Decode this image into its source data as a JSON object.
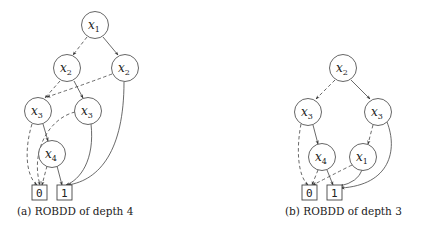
{
  "figures": [
    {
      "id": "a",
      "caption": "(a) ROBDD of depth 4",
      "nodes": [
        {
          "id": "a_x1",
          "var": "x",
          "sub": "1",
          "cx": 95,
          "cy": 25
        },
        {
          "id": "a_x2L",
          "var": "x",
          "sub": "2",
          "cx": 67,
          "cy": 68
        },
        {
          "id": "a_x2R",
          "var": "x",
          "sub": "2",
          "cx": 125,
          "cy": 68
        },
        {
          "id": "a_x3L",
          "var": "x",
          "sub": "3",
          "cx": 38,
          "cy": 111
        },
        {
          "id": "a_x3R",
          "var": "x",
          "sub": "3",
          "cx": 88,
          "cy": 111
        },
        {
          "id": "a_x4",
          "var": "x",
          "sub": "4",
          "cx": 52,
          "cy": 154
        }
      ],
      "terminals": [
        {
          "id": "a_0",
          "label": "0",
          "x": 32,
          "y": 185
        },
        {
          "id": "a_1",
          "label": "1",
          "x": 57,
          "y": 185
        }
      ],
      "edges": [
        {
          "from": "a_x1",
          "to": "a_x2L",
          "type": "dashed"
        },
        {
          "from": "a_x1",
          "to": "a_x2R",
          "type": "solid"
        },
        {
          "from": "a_x2L",
          "to": "a_x3L",
          "type": "dashed"
        },
        {
          "from": "a_x2L",
          "to": "a_x3R",
          "type": "solid"
        },
        {
          "from": "a_x2R",
          "to": "a_x3L",
          "type": "dashed"
        },
        {
          "from": "a_x2R",
          "to": "a_1",
          "type": "solid"
        },
        {
          "from": "a_x3L",
          "to": "a_0",
          "type": "dashed"
        },
        {
          "from": "a_x3L",
          "to": "a_x4",
          "type": "solid"
        },
        {
          "from": "a_x3R",
          "to": "a_0",
          "type": "dashed"
        },
        {
          "from": "a_x3R",
          "to": "a_1",
          "type": "solid"
        },
        {
          "from": "a_x4",
          "to": "a_0",
          "type": "dashed"
        },
        {
          "from": "a_x4",
          "to": "a_1",
          "type": "solid"
        }
      ]
    },
    {
      "id": "b",
      "caption": "(b) ROBDD of depth 3",
      "nodes": [
        {
          "id": "b_x2",
          "var": "x",
          "sub": "2",
          "cx": 343,
          "cy": 68
        },
        {
          "id": "b_x3L",
          "var": "x",
          "sub": "3",
          "cx": 308,
          "cy": 112
        },
        {
          "id": "b_x3R",
          "var": "x",
          "sub": "3",
          "cx": 378,
          "cy": 112
        },
        {
          "id": "b_x4",
          "var": "x",
          "sub": "4",
          "cx": 322,
          "cy": 157
        },
        {
          "id": "b_x1",
          "var": "x",
          "sub": "1",
          "cx": 363,
          "cy": 157
        }
      ],
      "terminals": [
        {
          "id": "b_0",
          "label": "0",
          "x": 302,
          "y": 185
        },
        {
          "id": "b_1",
          "label": "1",
          "x": 327,
          "y": 185
        }
      ],
      "edges": [
        {
          "from": "b_x2",
          "to": "b_x3L",
          "type": "dashed"
        },
        {
          "from": "b_x2",
          "to": "b_x3R",
          "type": "solid"
        },
        {
          "from": "b_x3L",
          "to": "b_0",
          "type": "dashed"
        },
        {
          "from": "b_x3L",
          "to": "b_x4",
          "type": "solid"
        },
        {
          "from": "b_x3R",
          "to": "b_x1",
          "type": "dashed"
        },
        {
          "from": "b_x3R",
          "to": "b_1",
          "type": "solid"
        },
        {
          "from": "b_x4",
          "to": "b_0",
          "type": "dashed"
        },
        {
          "from": "b_x4",
          "to": "b_1",
          "type": "solid"
        },
        {
          "from": "b_x1",
          "to": "b_0",
          "type": "dashed"
        },
        {
          "from": "b_x1",
          "to": "b_1",
          "type": "solid"
        }
      ]
    }
  ],
  "legend_semantics": {
    "dashed": "low (0) edge",
    "solid": "high (1) edge"
  }
}
